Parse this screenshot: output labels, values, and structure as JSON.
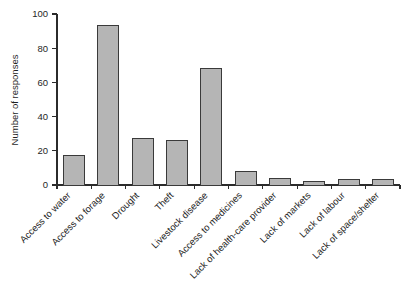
{
  "chart_data": {
    "type": "bar",
    "title": "",
    "subtitle": "",
    "xlabel": "",
    "ylabel": "Number of responses",
    "ylim": [
      0,
      100
    ],
    "yticks": [
      0,
      20,
      40,
      60,
      80,
      100
    ],
    "ytick_labels": [
      "0",
      "20",
      "40",
      "60",
      "80",
      "100"
    ],
    "grid": false,
    "legend": false,
    "legend_position": "none",
    "xtick_label_rotation": -45,
    "categories": [
      "Access to water",
      "Access to forage",
      "Drought",
      "Theft",
      "Livestock disease",
      "Access to medicines",
      "Lack of health-care provider",
      "Lack of markets",
      "Lack of labour",
      "Lack of space/shelter"
    ],
    "values": [
      17,
      93,
      27,
      26,
      68,
      8,
      4,
      2,
      3,
      3
    ],
    "colors": {
      "bar_fill": "#b5b5b5",
      "bar_stroke": "#3a3a3a",
      "axis": "#2b2b2b",
      "text": "#1f1f1f",
      "background": "#ffffff"
    }
  }
}
